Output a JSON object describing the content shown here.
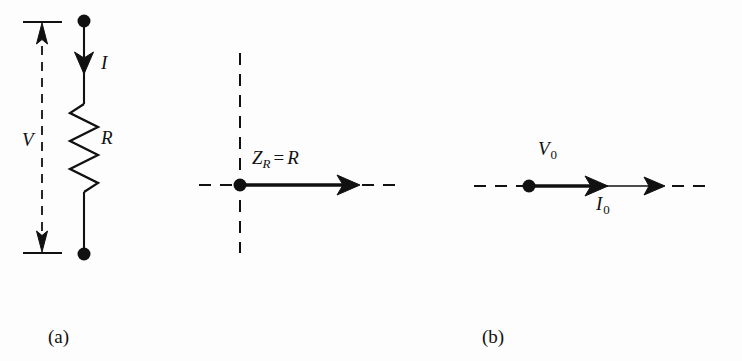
{
  "figure": {
    "background_color": "#fdfdfd",
    "ink_color": "#111111"
  },
  "panels": [
    {
      "id": "a",
      "caption": "(a)",
      "description": "resistor-circuit",
      "labels": {
        "voltage": "V",
        "current": "I",
        "resistance": "R"
      },
      "elements": {
        "voltage_arrow": "double-headed-dashed-arrow",
        "current_arrow": "downward-arrow",
        "resistor": "zigzag-resistor",
        "terminal_top": "filled-circle-terminal",
        "terminal_bottom": "filled-circle-terminal"
      }
    },
    {
      "id": "b",
      "caption": "(b)",
      "description": "impedance-phasor-diagram",
      "labels": {
        "impedance": {
          "symbol": "Z",
          "subscript": "R",
          "operator": "=",
          "value": "R"
        }
      },
      "elements": {
        "real_axis": "horizontal-dashed-axis",
        "imaginary_axis": "vertical-dashed-axis",
        "origin": "filled-circle-origin",
        "phasor": "horizontal-solid-arrow"
      }
    },
    {
      "id": "c",
      "caption": "(c)",
      "description": "voltage-current-phasor-diagram",
      "labels": {
        "voltage_amplitude": {
          "symbol": "V",
          "subscript": "0"
        },
        "current_amplitude": {
          "symbol": "I",
          "subscript": "0"
        }
      },
      "elements": {
        "real_axis": "horizontal-dashed-axis",
        "origin": "filled-circle-origin",
        "voltage_phasor": "thick-horizontal-arrow",
        "current_phasor": "thin-horizontal-arrow"
      }
    }
  ]
}
